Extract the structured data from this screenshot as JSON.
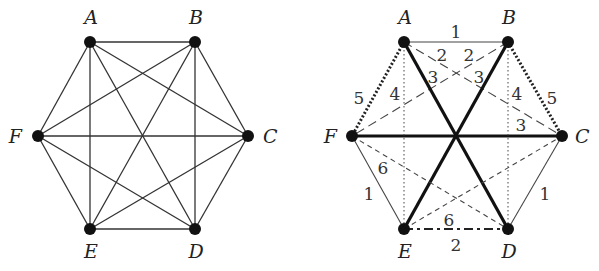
{
  "graphs": [
    {
      "id": "left",
      "description": "Complete graph K6 on vertices A-F",
      "nodes": [
        {
          "id": "A",
          "label": "A",
          "x": 90,
          "y": 42,
          "lx": 91,
          "ly": 24,
          "anchor": "middle"
        },
        {
          "id": "B",
          "label": "B",
          "x": 195,
          "y": 42,
          "lx": 196,
          "ly": 24,
          "anchor": "middle"
        },
        {
          "id": "C",
          "label": "C",
          "x": 248,
          "y": 136,
          "lx": 263,
          "ly": 143,
          "anchor": "start"
        },
        {
          "id": "D",
          "label": "D",
          "x": 195,
          "y": 229,
          "lx": 196,
          "ly": 258,
          "anchor": "middle"
        },
        {
          "id": "E",
          "label": "E",
          "x": 90,
          "y": 229,
          "lx": 91,
          "ly": 258,
          "anchor": "middle"
        },
        {
          "id": "F",
          "label": "F",
          "x": 38,
          "y": 136,
          "lx": 22,
          "ly": 143,
          "anchor": "end"
        }
      ],
      "edges": [
        {
          "from": "A",
          "to": "B",
          "style": "solid"
        },
        {
          "from": "A",
          "to": "C",
          "style": "solid"
        },
        {
          "from": "A",
          "to": "D",
          "style": "solid"
        },
        {
          "from": "A",
          "to": "E",
          "style": "solid"
        },
        {
          "from": "A",
          "to": "F",
          "style": "solid"
        },
        {
          "from": "B",
          "to": "C",
          "style": "solid"
        },
        {
          "from": "B",
          "to": "D",
          "style": "solid"
        },
        {
          "from": "B",
          "to": "E",
          "style": "solid"
        },
        {
          "from": "B",
          "to": "F",
          "style": "solid"
        },
        {
          "from": "C",
          "to": "D",
          "style": "solid"
        },
        {
          "from": "C",
          "to": "E",
          "style": "solid"
        },
        {
          "from": "C",
          "to": "F",
          "style": "solid"
        },
        {
          "from": "D",
          "to": "E",
          "style": "solid"
        },
        {
          "from": "D",
          "to": "F",
          "style": "solid"
        },
        {
          "from": "E",
          "to": "F",
          "style": "solid"
        }
      ]
    },
    {
      "id": "right",
      "description": "K6 edge coloring into 5 perfect matchings (weights 1-6 label line styles)",
      "nodes": [
        {
          "id": "A",
          "label": "A",
          "x": 404,
          "y": 42,
          "lx": 405,
          "ly": 24,
          "anchor": "middle"
        },
        {
          "id": "B",
          "label": "B",
          "x": 508,
          "y": 42,
          "lx": 509,
          "ly": 24,
          "anchor": "middle"
        },
        {
          "id": "C",
          "label": "C",
          "x": 562,
          "y": 136,
          "lx": 575,
          "ly": 143,
          "anchor": "start"
        },
        {
          "id": "D",
          "label": "D",
          "x": 508,
          "y": 229,
          "lx": 509,
          "ly": 258,
          "anchor": "middle"
        },
        {
          "id": "E",
          "label": "E",
          "x": 404,
          "y": 229,
          "lx": 405,
          "ly": 258,
          "anchor": "middle"
        },
        {
          "id": "F",
          "label": "F",
          "x": 352,
          "y": 136,
          "lx": 337,
          "ly": 143,
          "anchor": "end"
        }
      ],
      "edges": [
        {
          "from": "A",
          "to": "B",
          "style": "thin",
          "weight": "1",
          "wx": 456,
          "wy": 38
        },
        {
          "from": "F",
          "to": "E",
          "style": "thin",
          "weight": "1",
          "wx": 369,
          "wy": 200
        },
        {
          "from": "C",
          "to": "D",
          "style": "thin",
          "weight": "1",
          "wx": 545,
          "wy": 200
        },
        {
          "from": "A",
          "to": "C",
          "style": "longdash",
          "weight": "2",
          "wx": 442,
          "wy": 61
        },
        {
          "from": "B",
          "to": "F",
          "style": "longdash",
          "weight": "2",
          "wx": 469,
          "wy": 61
        },
        {
          "from": "E",
          "to": "D",
          "style": "dashdot",
          "weight": "2",
          "wx": 456,
          "wy": 251
        },
        {
          "from": "A",
          "to": "D",
          "style": "thick",
          "weight": "3",
          "wx": 433,
          "wy": 83
        },
        {
          "from": "B",
          "to": "E",
          "style": "thick",
          "weight": "3",
          "wx": 479,
          "wy": 83
        },
        {
          "from": "F",
          "to": "C",
          "style": "thick",
          "weight": "3",
          "wx": 521,
          "wy": 131
        },
        {
          "from": "A",
          "to": "E",
          "style": "finedot",
          "weight": "4",
          "wx": 395,
          "wy": 100
        },
        {
          "from": "B",
          "to": "D",
          "style": "finedot",
          "weight": "4",
          "wx": 517,
          "wy": 100
        },
        {
          "from": "A",
          "to": "F",
          "style": "heavydot",
          "weight": "5",
          "wx": 359,
          "wy": 104
        },
        {
          "from": "B",
          "to": "C",
          "style": "heavydot",
          "weight": "5",
          "wx": 552,
          "wy": 104
        },
        {
          "from": "F",
          "to": "D",
          "style": "shortdash",
          "weight": "6",
          "wx": 383,
          "wy": 174
        },
        {
          "from": "E",
          "to": "C",
          "style": "shortdash",
          "weight": "6",
          "wx": 449,
          "wy": 226
        }
      ]
    }
  ],
  "line_styles": {
    "solid": {
      "width": 1.3,
      "dash": "",
      "color": "#333333"
    },
    "thin": {
      "width": 1.1,
      "dash": "",
      "color": "#444444"
    },
    "thick": {
      "width": 3.2,
      "dash": "",
      "color": "#111111"
    },
    "longdash": {
      "width": 1.1,
      "dash": "9 5",
      "color": "#444444"
    },
    "shortdash": {
      "width": 1.1,
      "dash": "5 4",
      "color": "#444444"
    },
    "dashdot": {
      "width": 2.2,
      "dash": "9 4 3 4",
      "color": "#222222"
    },
    "finedot": {
      "width": 1.0,
      "dash": "1.5 2.5",
      "color": "#444444"
    },
    "heavydot": {
      "width": 3.0,
      "dash": "2 2",
      "color": "#222222"
    }
  },
  "node_radius": 6
}
